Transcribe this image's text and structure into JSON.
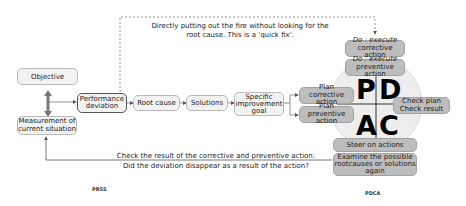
{
  "notes": {
    "quick_fix_line1": "Directly putting out the fire without looking for the",
    "quick_fix_line2": "root cause. This is a 'quick fix'.",
    "check_line1": "Check the result of the corrective and preventive action:",
    "check_line2": "Did the deviation disappear as a result of the action?"
  },
  "press": {
    "objective": "Objective",
    "measurement_line1": "Measurement of",
    "measurement_line2": "current situation",
    "performance_line1": "Performance",
    "performance_line2": "deviation",
    "root_cause": "Root cause",
    "solutions": "Solutions",
    "goal_line1": "Specific",
    "goal_line2": "improvement",
    "goal_line3": "goal",
    "caption": "PRSS"
  },
  "pdca": {
    "do_corrective_italic": "Do : execute",
    "do_corrective": "corrective action",
    "do_preventive_italic": "Do : execute",
    "do_preventive": "preventive action",
    "plan_corrective_line1": "Plan",
    "plan_corrective_line2": "corrective action",
    "plan_preventive_line1": "Plan",
    "plan_preventive_line2": "preventive action",
    "check_line1": "Check plan",
    "check_line2": "Check result",
    "steer": "Steer on actions",
    "examine_line1": "Examine the possible",
    "examine_line2": "rootcauses or solutions",
    "examine_line3": "again",
    "letters": {
      "p": "P",
      "d": "D",
      "a": "A",
      "c": "C"
    },
    "caption": "PDCA"
  },
  "colors": {
    "light_box": "#f2f2f2",
    "grey_box": "#bdbdbd",
    "circle": "#eeeeee",
    "arrow": "#555555"
  }
}
